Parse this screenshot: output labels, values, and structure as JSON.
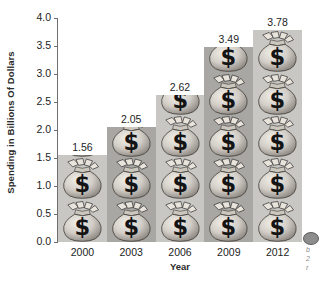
{
  "chart_data": {
    "type": "bar",
    "title": "",
    "subtitle": "",
    "xlabel": "Year",
    "ylabel": "Spending in Billions Of Dollars",
    "categories": [
      "2000",
      "2003",
      "2006",
      "2009",
      "2012"
    ],
    "values": [
      1.56,
      2.05,
      2.62,
      3.49,
      3.78
    ],
    "value_labels": [
      "1.56",
      "2.05",
      "2.62",
      "3.49",
      "3.78"
    ],
    "ylim": [
      0.0,
      4.0
    ],
    "ytick_labels": [
      "0.0",
      "0.5",
      "1.0",
      "1.5",
      "2.0",
      "2.5",
      "3.0",
      "3.5",
      "4.0"
    ],
    "ytick_values": [
      0.0,
      0.5,
      1.0,
      1.5,
      2.0,
      2.5,
      3.0,
      3.5,
      4.0
    ],
    "grid": false,
    "legend": false,
    "legend_position": "none",
    "pictogram": "money-bag",
    "bar_tones": [
      "light",
      "dark",
      "light",
      "dark",
      "light"
    ],
    "annotations": []
  },
  "axes": {
    "y_title": "Spending in Billions Of Dollars",
    "x_title": "Year"
  },
  "colors": {
    "background": "#ffffff",
    "axis": "#6f6f6f",
    "text": "#1d1d1d",
    "bar_light": "#c9c7c4",
    "bar_dark": "#a9a7a4",
    "bag_body": "#d6d2cc",
    "bag_shadow": "#8f8a84",
    "bag_symbol": "#1a1a1a"
  },
  "margin_note": {
    "line1": "b",
    "line2": "2",
    "line3": "r"
  }
}
